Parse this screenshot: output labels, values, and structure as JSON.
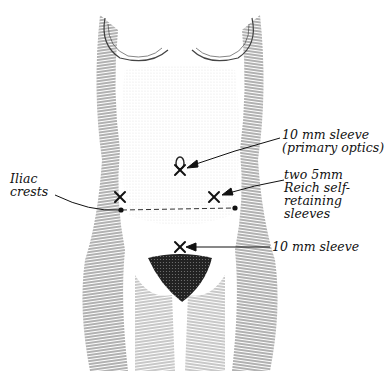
{
  "figure": {
    "type": "anatomical illustration"
  },
  "labels": {
    "primary_sleeve": {
      "line1": "10 mm sleeve",
      "line2": "(primary optics)"
    },
    "reich_sleeves": {
      "line1": "two 5mm",
      "line2": "Reich self-",
      "line3": "retaining",
      "line4": "sleeves"
    },
    "iliac": {
      "line1": "Iliac",
      "line2": "crests"
    },
    "lower_sleeve": {
      "line1": "10 mm sleeve"
    }
  },
  "markers": [
    {
      "name": "umbilical-port",
      "symbol": "X",
      "x": 180,
      "y": 170
    },
    {
      "name": "left-lateral-port",
      "symbol": "X",
      "x": 120,
      "y": 197
    },
    {
      "name": "right-lateral-port",
      "symbol": "X",
      "x": 214,
      "y": 197
    },
    {
      "name": "suprapubic-port",
      "symbol": "X",
      "x": 180,
      "y": 247
    }
  ],
  "colors": {
    "ink": "#111111",
    "background": "#ffffff",
    "shade": "#555555"
  }
}
